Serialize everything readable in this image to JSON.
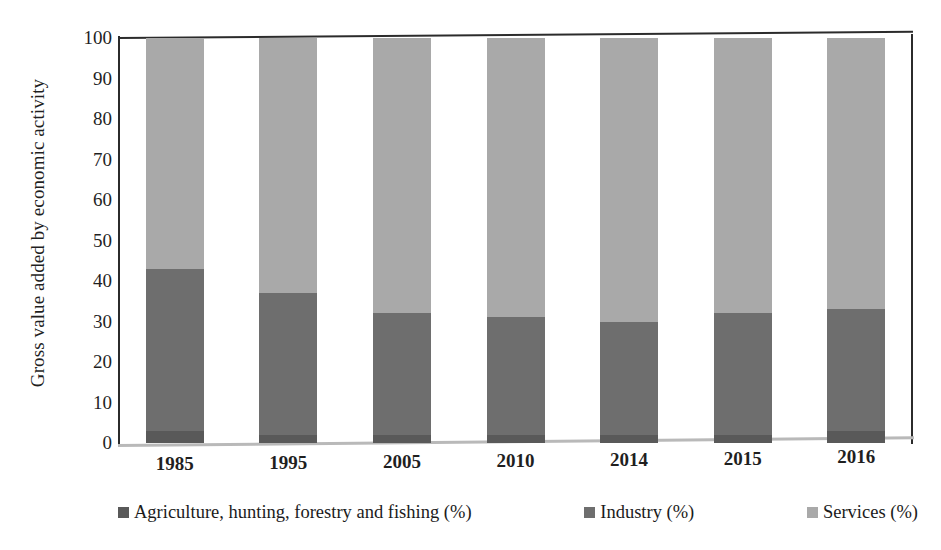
{
  "chart_data": {
    "type": "bar",
    "subtype": "stacked-percentage",
    "title": "",
    "xlabel": "",
    "ylabel": "Gross value added by economic activity",
    "ylim": [
      0,
      100
    ],
    "yticks": [
      0,
      10,
      20,
      30,
      40,
      50,
      60,
      70,
      80,
      90,
      100
    ],
    "grid": false,
    "legend_position": "bottom",
    "categories": [
      "1985",
      "1995",
      "2005",
      "2010",
      "2014",
      "2015",
      "2016"
    ],
    "series": [
      {
        "name": "Agriculture, hunting, forestry and fishing (%)",
        "color": "#595959",
        "values": [
          3,
          2,
          2,
          2,
          2,
          2,
          3
        ]
      },
      {
        "name": "Industry (%)",
        "color": "#6e6e6e",
        "values": [
          40,
          35,
          30,
          29,
          28,
          30,
          30
        ]
      },
      {
        "name": "Services (%)",
        "color": "#a9a9a9",
        "values": [
          57,
          63,
          68,
          69,
          70,
          68,
          67
        ]
      }
    ],
    "cumulative_tops": {
      "agriculture": [
        3,
        2,
        2,
        2,
        2,
        2,
        3
      ],
      "industry": [
        43,
        37,
        32,
        31,
        30,
        32,
        33
      ],
      "services": [
        100,
        100,
        100,
        100,
        100,
        100,
        100
      ]
    }
  },
  "axis": {
    "y_title": "Gross value added by economic activity",
    "y_tick_labels": [
      "100",
      "90",
      "80",
      "70",
      "60",
      "50",
      "40",
      "30",
      "20",
      "10",
      "0"
    ],
    "x_tick_labels": [
      "1985",
      "1995",
      "2005",
      "2010",
      "2014",
      "2015",
      "2016"
    ]
  },
  "legend": {
    "items": [
      {
        "label": "Agriculture, hunting, forestry and fishing (%)",
        "color": "#595959"
      },
      {
        "label": "Industry (%)",
        "color": "#6e6e6e"
      },
      {
        "label": "Services (%)",
        "color": "#a9a9a9"
      }
    ]
  },
  "colors": {
    "agriculture": "#595959",
    "industry": "#6e6e6e",
    "services": "#a9a9a9",
    "axis": "#2b2b2b",
    "baseline": "#b9b9b9",
    "text": "#1f1f1f",
    "background": "#ffffff"
  }
}
